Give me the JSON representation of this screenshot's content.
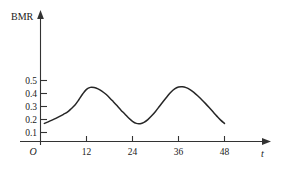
{
  "chart_data": {
    "type": "line",
    "title": "",
    "subtitle": "",
    "xlabel": "t",
    "ylabel": "BMR",
    "origin_label": "O",
    "grid": false,
    "legend": null,
    "xlim": [
      0,
      54
    ],
    "ylim": [
      0,
      0.58
    ],
    "xticks": [
      12,
      24,
      36,
      48
    ],
    "xtick_labels": [
      "12",
      "24",
      "36",
      "48"
    ],
    "yticks": [
      0.1,
      0.2,
      0.3,
      0.4,
      0.5
    ],
    "ytick_labels": [
      "0.1",
      "0.2",
      "0.3",
      "0.4",
      "0.5"
    ],
    "series": [
      {
        "name": "BMR",
        "color": "#262626",
        "x": [
          1,
          2,
          3,
          4,
          5,
          6,
          7,
          8,
          9,
          10,
          11,
          12,
          13,
          14,
          15,
          16,
          17,
          18,
          19,
          20,
          21,
          22,
          23,
          24,
          25,
          26,
          27,
          28,
          29,
          30,
          31,
          32,
          33,
          34,
          35,
          36,
          37,
          38,
          39,
          40,
          41,
          42,
          43,
          44,
          45,
          46,
          47,
          48
        ],
        "y": [
          0.17,
          0.182,
          0.195,
          0.209,
          0.224,
          0.24,
          0.257,
          0.283,
          0.312,
          0.352,
          0.396,
          0.432,
          0.447,
          0.446,
          0.436,
          0.419,
          0.396,
          0.368,
          0.337,
          0.305,
          0.272,
          0.242,
          0.211,
          0.186,
          0.17,
          0.168,
          0.178,
          0.199,
          0.228,
          0.262,
          0.3,
          0.338,
          0.375,
          0.41,
          0.436,
          0.45,
          0.452,
          0.445,
          0.43,
          0.409,
          0.383,
          0.354,
          0.324,
          0.292,
          0.259,
          0.226,
          0.195,
          0.17
        ]
      }
    ],
    "annotations": [],
    "axis_arrows": {
      "x_arrow": true,
      "y_arrow": true
    }
  }
}
